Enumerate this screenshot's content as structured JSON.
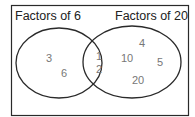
{
  "diagram": {
    "type": "venn",
    "sets": [
      {
        "label": "Factors of 6",
        "only": [
          "3",
          "6"
        ]
      },
      {
        "label": "Factors of 20",
        "only": [
          "4",
          "10",
          "5",
          "20"
        ]
      }
    ],
    "intersection": [
      "1",
      "2"
    ]
  },
  "colors": {
    "outline": "#2a2a2a",
    "label": "#222222",
    "number": "#777777",
    "background": "#ffffff"
  }
}
